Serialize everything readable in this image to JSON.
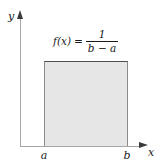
{
  "figure": {
    "type": "uniform-distribution-pdf",
    "background_color": "#ffffff"
  },
  "axes": {
    "y_label": "y",
    "x_label": "x",
    "axis_color": "#a6a6a6",
    "arrow_color": "#3a3a3a"
  },
  "ticks": {
    "left_label": "a",
    "right_label": "b"
  },
  "formula": {
    "lhs": "f(x)",
    "equals": "=",
    "numerator": "1",
    "denominator": "b − a"
  },
  "region": {
    "fill_color": "#e6e6e6",
    "border_color": "#4d4d4d"
  },
  "chart_data": {
    "type": "area",
    "title": "",
    "xlabel": "x",
    "ylabel": "y",
    "annotations": [
      "f(x) = 1/(b − a)"
    ],
    "x": [
      "a",
      "b"
    ],
    "values": [
      1,
      1
    ],
    "series": [
      {
        "name": "f(x) = 1/(b - a)",
        "x": [
          "a",
          "b"
        ],
        "values": [
          1,
          1
        ]
      }
    ],
    "tick_labels": {
      "x": [
        "a",
        "b"
      ],
      "y": []
    },
    "grid": false,
    "legend": "none"
  }
}
